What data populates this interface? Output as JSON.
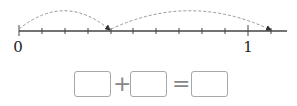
{
  "number_line": {
    "start_label": "0",
    "end_label": "1",
    "divisions": 10,
    "ticks_shown": 12,
    "jumps": [
      {
        "from_tick": 0,
        "to_tick": 4,
        "style": "dashed-arc"
      },
      {
        "from_tick": 4,
        "to_tick": 11,
        "style": "dashed-arc"
      }
    ],
    "colors": {
      "axis": "#444444",
      "arc": "#999999",
      "box_border": "#a8a8a8"
    }
  },
  "equation": {
    "box1_value": "",
    "operator1": "+",
    "box2_value": "",
    "operator2": "=",
    "box3_value": ""
  }
}
